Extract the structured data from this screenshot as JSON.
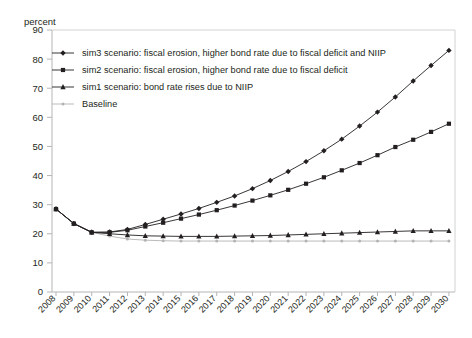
{
  "chart_data": {
    "type": "line",
    "title": "",
    "ylabel": "percent",
    "xlabel": "",
    "ylim": [
      0,
      90
    ],
    "ytick_step": 10,
    "yticks": [
      0,
      10,
      20,
      30,
      40,
      50,
      60,
      70,
      80,
      90
    ],
    "grid": false,
    "legend_position": "top-left",
    "categories": [
      "2008",
      "2009",
      "2010",
      "2011",
      "2012",
      "2013",
      "2014",
      "2015",
      "2016",
      "2017",
      "2018",
      "2019",
      "2020",
      "2021",
      "2022",
      "2023",
      "2024",
      "2025",
      "2026",
      "2027",
      "2028",
      "2029",
      "2030"
    ],
    "series": [
      {
        "name": "sim3 scenario: fiscal erosion, higher bond rate due to fiscal deficit and NIIP",
        "marker": "diamond",
        "color": "#231f20",
        "values": [
          28.5,
          23.5,
          20.5,
          20.6,
          21.5,
          23.2,
          25.0,
          26.8,
          28.7,
          30.8,
          33.0,
          35.5,
          38.3,
          41.4,
          44.8,
          48.5,
          52.5,
          57.0,
          61.8,
          67.0,
          72.5,
          77.8,
          83.0
        ]
      },
      {
        "name": "sim2 scenario: fiscal erosion, higher bond rate due to fiscal deficit",
        "marker": "square",
        "color": "#231f20",
        "values": [
          28.5,
          23.5,
          20.5,
          20.5,
          21.2,
          22.5,
          23.8,
          25.2,
          26.6,
          28.1,
          29.7,
          31.4,
          33.2,
          35.1,
          37.2,
          39.4,
          41.8,
          44.3,
          47.0,
          49.8,
          52.3,
          55.0,
          57.8
        ]
      },
      {
        "name": "sim1 scenario: bond rate rises due to NIIP",
        "marker": "triangle",
        "color": "#231f20",
        "values": [
          28.5,
          23.5,
          20.5,
          20.0,
          19.6,
          19.3,
          19.2,
          19.1,
          19.1,
          19.1,
          19.2,
          19.3,
          19.4,
          19.6,
          19.8,
          20.0,
          20.2,
          20.4,
          20.6,
          20.8,
          21.0,
          21.0,
          21.0
        ]
      },
      {
        "name": "Baseline",
        "marker": "dot",
        "color": "#b3b3b3",
        "values": [
          28.5,
          23.5,
          20.5,
          19.2,
          18.2,
          17.8,
          17.6,
          17.5,
          17.5,
          17.5,
          17.5,
          17.5,
          17.5,
          17.5,
          17.5,
          17.5,
          17.5,
          17.5,
          17.5,
          17.5,
          17.5,
          17.5,
          17.5
        ]
      }
    ]
  }
}
